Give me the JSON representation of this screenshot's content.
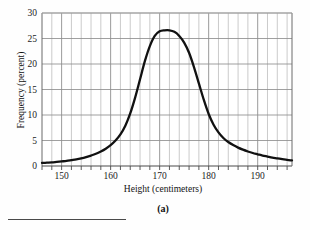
{
  "figure": {
    "caption": "(a)",
    "background_color": "#fefefe",
    "curve_color": "#111111",
    "grid_color": "#b4b4b4",
    "axis_color": "#6b6b6b"
  },
  "chart_data": {
    "type": "line",
    "title": "",
    "xlabel": "Height (centimeters)",
    "ylabel": "Frequency (percent)",
    "xlim": [
      146,
      197
    ],
    "ylim": [
      0,
      30
    ],
    "xticks": [
      150,
      160,
      170,
      180,
      190
    ],
    "xtick_labels": [
      "150",
      "160",
      "170",
      "180",
      "190"
    ],
    "yticks": [
      0,
      5,
      10,
      15,
      20,
      25,
      30
    ],
    "ytick_labels": [
      "0",
      "5",
      "10",
      "15",
      "20",
      "25",
      "30"
    ],
    "x_minor_step": 2,
    "grid": true,
    "legend": false,
    "peak_x": 172,
    "peak_y": 26.6,
    "series": [
      {
        "name": "Height frequency distribution",
        "x": [
          146,
          147,
          148,
          149,
          150,
          151,
          152,
          153,
          154,
          155,
          156,
          157,
          158,
          159,
          160,
          161,
          162,
          163,
          164,
          165,
          166,
          167,
          168,
          169,
          170,
          171,
          172,
          173,
          174,
          175,
          176,
          177,
          178,
          179,
          180,
          181,
          182,
          183,
          184,
          185,
          186,
          187,
          188,
          189,
          190,
          191,
          192,
          193,
          194,
          195,
          196,
          197
        ],
        "y": [
          0.6,
          0.65,
          0.7,
          0.8,
          0.9,
          1.0,
          1.15,
          1.3,
          1.5,
          1.75,
          2.05,
          2.4,
          2.85,
          3.4,
          4.1,
          5.0,
          6.2,
          7.9,
          10.3,
          13.4,
          17.0,
          20.6,
          23.5,
          25.5,
          26.4,
          26.6,
          26.6,
          26.3,
          25.5,
          24.2,
          22.2,
          19.4,
          16.2,
          13.0,
          10.2,
          8.1,
          6.6,
          5.5,
          4.7,
          4.1,
          3.6,
          3.2,
          2.85,
          2.55,
          2.3,
          2.05,
          1.85,
          1.65,
          1.5,
          1.35,
          1.2,
          1.1
        ]
      }
    ]
  }
}
